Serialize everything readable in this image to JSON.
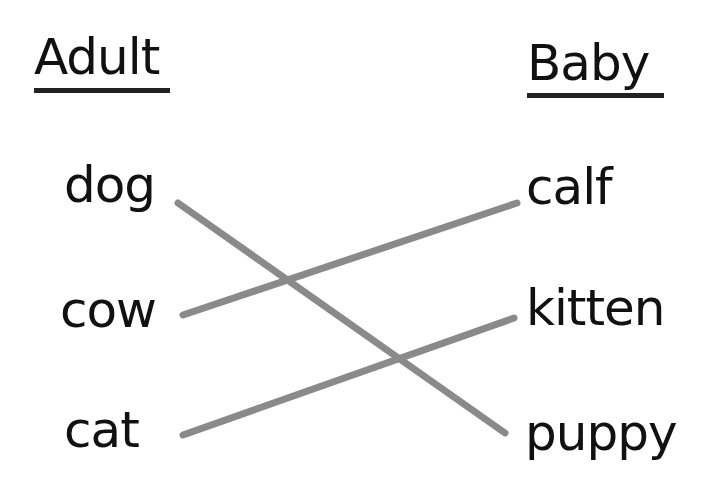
{
  "columns": {
    "left": {
      "heading": "Adult",
      "items": [
        "dog",
        "cow",
        "cat"
      ]
    },
    "right": {
      "heading": "Baby",
      "items": [
        "calf",
        "kitten",
        "puppy"
      ]
    }
  },
  "matches": [
    {
      "adult": "dog",
      "baby": "puppy"
    },
    {
      "adult": "cow",
      "baby": "calf"
    },
    {
      "adult": "cat",
      "baby": "kitten"
    }
  ],
  "colors": {
    "text": "#111111",
    "line": "#8a8a8a"
  }
}
